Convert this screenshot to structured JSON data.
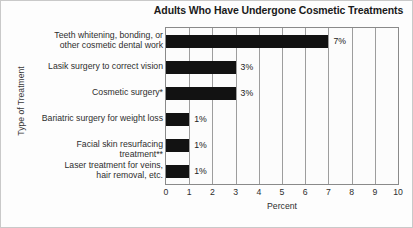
{
  "chart_data": {
    "type": "bar",
    "orientation": "horizontal",
    "title": "Adults Who Have Undergone Cosmetic Treatments",
    "xlabel": "Percent",
    "ylabel": "Type of Treatment",
    "xlim": [
      0,
      10
    ],
    "xticks": [
      0,
      1,
      2,
      3,
      4,
      5,
      6,
      7,
      8,
      9,
      10
    ],
    "xtick_labels": [
      "0",
      "1",
      "2",
      "3",
      "4",
      "5",
      "6",
      "7",
      "8",
      "9",
      "10"
    ],
    "grid": "vertical",
    "legend": "none",
    "bar_color": "#121212",
    "categories": [
      "Teeth whitening, bonding, or\nother cosmetic dental work",
      "Lasik surgery to correct vision",
      "Cosmetic surgery*",
      "Bariatric surgery for weight loss",
      "Facial skin resurfacing treatment**",
      "Laser treatment for veins,\nhair removal, etc."
    ],
    "values": [
      7,
      3,
      3,
      1,
      1,
      1
    ],
    "data_labels": [
      "7%",
      "3%",
      "3%",
      "1%",
      "1%",
      "1%"
    ]
  }
}
